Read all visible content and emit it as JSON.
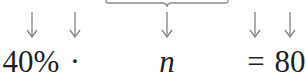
{
  "equation": {
    "terms": [
      {
        "id": "percent",
        "text": "40%",
        "x": 31
      },
      {
        "id": "times",
        "text": "·",
        "x": 75
      },
      {
        "id": "variable",
        "text": "n",
        "x": 167,
        "italic": true
      },
      {
        "id": "equals",
        "text": "=",
        "x": 256
      },
      {
        "id": "result",
        "text": "80",
        "x": 290
      }
    ]
  },
  "arrows": {
    "color": "#8a8a8a",
    "x_positions": [
      32,
      75,
      167,
      255,
      290
    ]
  },
  "brace": {
    "color": "#8a8a8a",
    "x_start": 106,
    "x_end": 228,
    "tip_x": 167
  },
  "colors": {
    "text": "#1f1f1f",
    "background": "#ffffff"
  }
}
